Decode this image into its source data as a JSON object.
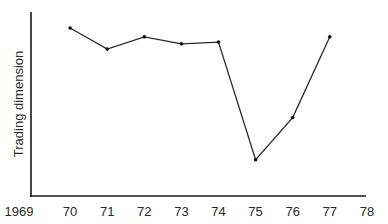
{
  "chart_data": {
    "type": "line",
    "title": "",
    "xlabel": "",
    "ylabel": "Trading dimension",
    "x_tick_labels": [
      "1969",
      "70",
      "71",
      "72",
      "73",
      "74",
      "75",
      "76",
      "77",
      "78"
    ],
    "x": [
      1970,
      1971,
      1972,
      1973,
      1974,
      1975,
      1976,
      1977
    ],
    "categories": [
      "70",
      "71",
      "72",
      "73",
      "74",
      "75",
      "76",
      "77"
    ],
    "values": [
      0.9,
      0.78,
      0.85,
      0.81,
      0.82,
      0.15,
      0.39,
      0.85
    ],
    "xlim": [
      1969,
      1978
    ],
    "ylim": [
      0,
      1
    ],
    "y_ticks_shown": false,
    "grid": false,
    "legend": null,
    "markers": true,
    "line_color": "#2a2a2a"
  }
}
